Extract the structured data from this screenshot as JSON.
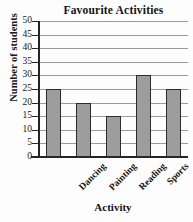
{
  "chart_data": {
    "type": "bar",
    "title": "Favourite Activities",
    "xlabel": "Activity",
    "ylabel": "Number of students",
    "categories": [
      "Dancing",
      "Painting",
      "Reading",
      "Sports",
      "Music"
    ],
    "values": [
      25,
      20,
      15,
      30,
      25
    ],
    "ylim": [
      0,
      50
    ],
    "ytick_step": 5,
    "yticks": [
      0,
      5,
      10,
      15,
      20,
      25,
      30,
      35,
      40,
      45,
      50
    ],
    "ytick_labels": [
      "0",
      "5",
      "10",
      "15",
      "20",
      "25",
      "30",
      "35",
      "40",
      "45",
      "50"
    ],
    "grid": true,
    "grid_axis": "y",
    "legend": false,
    "bar_color": "#9d9d9d",
    "bar_edge_color": "#2b2b2b",
    "grid_color": "#9a9a9a",
    "axis_color": "#242424",
    "xtick_rotation": -45
  }
}
